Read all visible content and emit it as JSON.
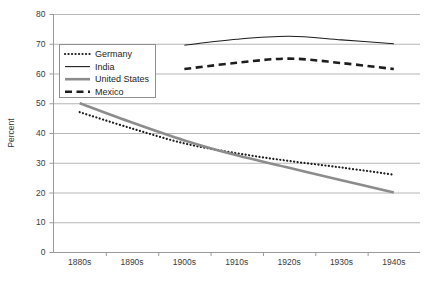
{
  "chart_data": {
    "type": "line",
    "title": "",
    "xlabel": "",
    "ylabel": "Percent",
    "ylim": [
      0,
      80
    ],
    "ytick_step": 10,
    "yticks": [
      "0",
      "10",
      "20",
      "30",
      "40",
      "50",
      "60",
      "70",
      "80"
    ],
    "categories": [
      "1880s",
      "1890s",
      "1900s",
      "1910s",
      "1920s",
      "1930s",
      "1940s"
    ],
    "grid": "horizontal",
    "legend_position": "upper-left-inside",
    "series": [
      {
        "name": "Germany",
        "style": "dotted",
        "color": "#1d1d1d",
        "values": [
          47,
          41.5,
          36.5,
          33.2,
          30.6,
          28.4,
          26
        ]
      },
      {
        "name": "India",
        "style": "solid-thin",
        "color": "#1d1d1d",
        "values": [
          null,
          null,
          69.5,
          71.5,
          72.5,
          71.3,
          70
        ]
      },
      {
        "name": "United States",
        "style": "solid-thick",
        "color": "#8c8c8c",
        "values": [
          50,
          43.5,
          37.5,
          32.5,
          28.3,
          24.1,
          20
        ]
      },
      {
        "name": "Mexico",
        "style": "dashed",
        "color": "#1d1d1d",
        "values": [
          null,
          null,
          61.5,
          63.6,
          65,
          63.5,
          61.5
        ]
      }
    ]
  },
  "legend": {
    "entries": [
      {
        "label": "Germany"
      },
      {
        "label": "India"
      },
      {
        "label": "United States"
      },
      {
        "label": "Mexico"
      }
    ]
  },
  "axes": {
    "y_title": "Percent"
  }
}
